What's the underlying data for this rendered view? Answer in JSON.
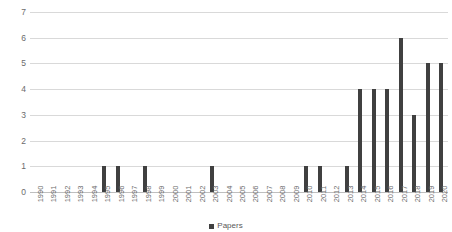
{
  "chart_data": {
    "type": "bar",
    "title": "",
    "xlabel": "",
    "ylabel": "",
    "ylim": [
      0,
      7
    ],
    "grid": true,
    "legend_position": "bottom",
    "bar_color": "#404040",
    "gridline_color": "#d9d9d9",
    "y_ticks": [
      7,
      6,
      5,
      4,
      3,
      2,
      1,
      0
    ],
    "categories": [
      "1990",
      "1991",
      "1992",
      "1993",
      "1994",
      "1995",
      "1996",
      "1997",
      "1998",
      "1999",
      "2000",
      "2001",
      "2002",
      "2003",
      "2004",
      "2005",
      "2006",
      "2007",
      "2008",
      "2009",
      "2010",
      "2011",
      "2012",
      "2013",
      "2014",
      "2015",
      "2016",
      "2017",
      "2018",
      "2019",
      "2020"
    ],
    "series": [
      {
        "name": "Papers",
        "values": [
          0,
          0,
          0,
          0,
          0,
          1,
          1,
          0,
          1,
          0,
          0,
          0,
          0,
          1,
          0,
          0,
          0,
          0,
          0,
          0,
          1,
          1,
          0,
          1,
          4,
          4,
          4,
          6,
          3,
          5,
          5
        ]
      }
    ],
    "legend": [
      "Papers"
    ]
  }
}
